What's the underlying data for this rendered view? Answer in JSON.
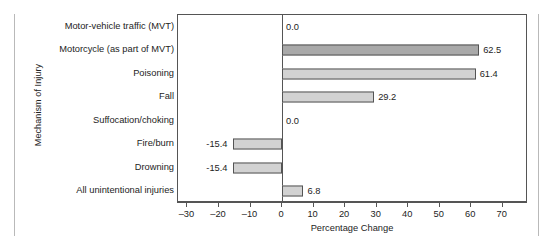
{
  "chart_data": {
    "type": "bar",
    "orientation": "horizontal",
    "title": "",
    "xlabel": "Percentage Change",
    "ylabel": "Mechanism of Injury",
    "categories": [
      "Motor-vehicle traffic (MVT)",
      "Motorcycle (as part of MVT)",
      "Poisoning",
      "Fall",
      "Suffocation/choking",
      "Fire/burn",
      "Drowning",
      "All unintentional injuries"
    ],
    "values": [
      0.0,
      62.5,
      61.4,
      29.2,
      0.0,
      -15.4,
      -15.4,
      6.8
    ],
    "value_labels": [
      "0.0",
      "62.5",
      "61.4",
      "29.2",
      "0.0",
      "-15.4",
      "-15.4",
      "6.8"
    ],
    "bar_colors": [
      "#cfcfcf",
      "#a9a9a9",
      "#d2d2d2",
      "#d2d2d2",
      "#cfcfcf",
      "#d2d2d2",
      "#d2d2d2",
      "#d2d2d2"
    ],
    "bar_edge_color": "#545454",
    "xlim": [
      -33,
      78
    ],
    "xticks": [
      -30,
      -20,
      -10,
      0,
      10,
      20,
      30,
      40,
      50,
      60,
      70
    ],
    "xtick_labels": [
      "–30",
      "–20",
      "–10",
      "0",
      "10",
      "20",
      "30",
      "40",
      "50",
      "60",
      "70"
    ],
    "grid": false,
    "legend": null,
    "zero_line": 0
  }
}
